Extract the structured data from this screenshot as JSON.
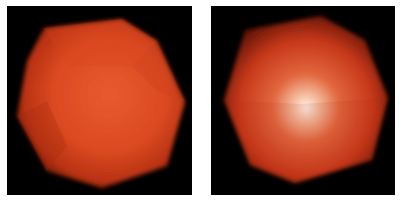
{
  "figure": {
    "panels": [
      {
        "id": "flat-shaded",
        "description": "Polyhedral sphere rendered with diffuse-only red-orange shading on black background",
        "background": "#000000",
        "base_color": "#d9471f",
        "highlight_color": "#e8603a"
      },
      {
        "id": "specular-shaded",
        "description": "Polyhedral sphere rendered with specular highlight at center, red-orange on black background",
        "background": "#000000",
        "base_color": "#c93a16",
        "highlight_color": "#fff4ee"
      }
    ]
  }
}
